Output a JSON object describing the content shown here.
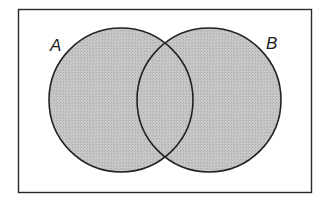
{
  "diagram": {
    "type": "venn",
    "universe": {
      "x": 18,
      "y": 9,
      "width": 293,
      "height": 183,
      "stroke": "#2a2a2a"
    },
    "sets": [
      {
        "label": "A",
        "cx": 121,
        "cy": 100,
        "r": 72,
        "label_x": 50,
        "label_y": 51
      },
      {
        "label": "B",
        "cx": 209,
        "cy": 100,
        "r": 72,
        "label_x": 266,
        "label_y": 49
      }
    ],
    "shaded_region": "A ∪ B",
    "fill_color": "#c4c4c4",
    "stroke_color": "#222222"
  }
}
